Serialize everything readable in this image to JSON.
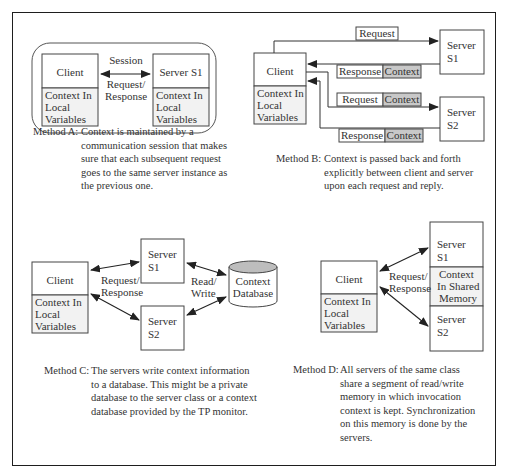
{
  "colors": {
    "frame": "#1e1e1e",
    "line": "#444444",
    "context_fill": "#c8c8c8",
    "db_top": "#bdbdbd",
    "shade": "#e8e8e8"
  },
  "method_a": {
    "session_label": "Session",
    "arrow_label_1": "Request/",
    "arrow_label_2": "Response",
    "client": {
      "title": "Client",
      "ctx1": "Context In",
      "ctx2": "Local",
      "ctx3": "Variables"
    },
    "server": {
      "title": "Server S1",
      "ctx1": "Context In",
      "ctx2": "Local",
      "ctx3": "Variables"
    },
    "caption_label": "Method A:",
    "caption_body": "Context is maintained by a\ncommunication session that makes\nsure that each subsequent request\ngoes to the same server instance as\nthe previous one."
  },
  "method_b": {
    "client": {
      "title": "Client",
      "ctx1": "Context In",
      "ctx2": "Local",
      "ctx3": "Variables"
    },
    "server1": {
      "line1": "Server",
      "line2": "S1"
    },
    "server2": {
      "line1": "Server",
      "line2": "S2"
    },
    "msg1": {
      "label": "Request"
    },
    "msg2": {
      "label": "Response",
      "ctx": "Context"
    },
    "msg3": {
      "label": "Request",
      "ctx": "Context"
    },
    "msg4": {
      "label": "Response",
      "ctx": "Context"
    },
    "caption_label": "Method B:",
    "caption_body": "Context is passed back and forth\nexplicitly between client and server\nupon each request and reply."
  },
  "method_c": {
    "client": {
      "title": "Client",
      "ctx1": "Context In",
      "ctx2": "Local",
      "ctx3": "Variables"
    },
    "server1": {
      "line1": "Server",
      "line2": "S1"
    },
    "server2": {
      "line1": "Server",
      "line2": "S2"
    },
    "arrow_label_1": "Request/",
    "arrow_label_2": "Response",
    "rw_label_1": "Read/",
    "rw_label_2": "Write",
    "db": {
      "line1": "Context",
      "line2": "Database"
    },
    "caption_label": "Method C:",
    "caption_body": "The servers write context information\nto a database. This might be a private\ndatabase to the server class or a context\ndatabase provided by the TP monitor."
  },
  "method_d": {
    "client": {
      "title": "Client",
      "ctx1": "Context In",
      "ctx2": "Local",
      "ctx3": "Variables"
    },
    "server1": {
      "line1": "Server",
      "line2": "S1"
    },
    "shared": {
      "line1": "Context",
      "line2": "In Shared",
      "line3": "Memory"
    },
    "server2": {
      "line1": "Server",
      "line2": "S2"
    },
    "arrow_label_1": "Request/",
    "arrow_label_2": "Response",
    "caption_label": "Method D:",
    "caption_body": "All servers of the same class\nshare a segment of read/write\nmemory in which invocation\ncontext is kept. Synchronization\non this memory is done by the\nservers."
  }
}
